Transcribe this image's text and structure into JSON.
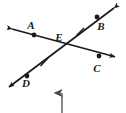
{
  "figure": {
    "kind": "geometry-diagram",
    "width": 126,
    "height": 113,
    "background_color": "#ffffff",
    "stroke_color": "#1a1a1a"
  },
  "labels": {
    "A": "A",
    "B": "B",
    "C": "C",
    "D": "D",
    "E": "E"
  },
  "points": [
    {
      "name": "A",
      "label": "A",
      "x": 34,
      "y": 35,
      "label_x": 31,
      "label_y": 29
    },
    {
      "name": "B",
      "label": "B",
      "x": 97,
      "y": 17,
      "label_x": 100,
      "label_y": 30
    },
    {
      "name": "C",
      "label": "C",
      "x": 99,
      "y": 56,
      "label_x": 96,
      "label_y": 72
    },
    {
      "name": "D",
      "label": "D",
      "x": 27,
      "y": 76,
      "label_x": 25,
      "label_y": 87
    },
    {
      "name": "E",
      "label": "E",
      "x": 62,
      "y": 44,
      "label_x": 57,
      "label_y": 40
    }
  ],
  "lines": [
    {
      "name": "line-AC",
      "from": [
        8,
        28
      ],
      "to": [
        119,
        58
      ],
      "arrows": "both"
    },
    {
      "name": "line-BD",
      "from": [
        118,
        5
      ],
      "to": [
        5,
        90
      ],
      "arrows": "both"
    }
  ],
  "tick_marks": [
    {
      "name": "tick-segment-EB",
      "x": 80,
      "y": 31
    },
    {
      "name": "tick-segment-ED",
      "x": 44,
      "y": 62
    }
  ],
  "annotation_arrow": {
    "name": "pointer-arrow",
    "direction": "up",
    "x": 62,
    "y_start": 113,
    "y_end": 88
  }
}
